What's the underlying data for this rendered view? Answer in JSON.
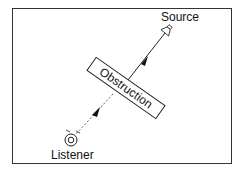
{
  "diagram": {
    "labels": {
      "source": "Source",
      "obstruction": "Obstruction",
      "listener": "Listener"
    },
    "colors": {
      "stroke": "#222222",
      "frame": "#333333",
      "background": "#ffffff"
    }
  }
}
